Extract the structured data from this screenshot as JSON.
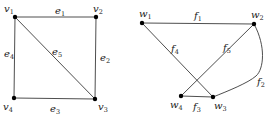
{
  "graphs": [
    {
      "name": "G",
      "vertices": [
        {
          "id": "v1",
          "base": "v",
          "sub": "1",
          "x": 15,
          "y": 17,
          "lx": 4,
          "ly": 12
        },
        {
          "id": "v2",
          "base": "v",
          "sub": "2",
          "x": 96,
          "y": 17,
          "lx": 93,
          "ly": 12
        },
        {
          "id": "v3",
          "base": "v",
          "sub": "3",
          "x": 95,
          "y": 99,
          "lx": 98,
          "ly": 110
        },
        {
          "id": "v4",
          "base": "v",
          "sub": "4",
          "x": 14,
          "y": 98,
          "lx": 3,
          "ly": 110
        }
      ],
      "edges": [
        {
          "id": "e1",
          "base": "e",
          "sub": "1",
          "from": "v1",
          "to": "v2",
          "lx": 55,
          "ly": 14
        },
        {
          "id": "e2",
          "base": "e",
          "sub": "2",
          "from": "v2",
          "to": "v3",
          "lx": 100,
          "ly": 61
        },
        {
          "id": "e3",
          "base": "e",
          "sub": "3",
          "from": "v4",
          "to": "v3",
          "lx": 50,
          "ly": 112
        },
        {
          "id": "e4",
          "base": "e",
          "sub": "4",
          "from": "v1",
          "to": "v4",
          "lx": 4,
          "ly": 57
        },
        {
          "id": "e5",
          "base": "e",
          "sub": "5",
          "from": "v1",
          "to": "v3",
          "lx": 52,
          "ly": 55
        }
      ]
    },
    {
      "name": "H",
      "vertices": [
        {
          "id": "w1",
          "base": "w",
          "sub": "1",
          "x": 142,
          "y": 23,
          "lx": 139,
          "ly": 17
        },
        {
          "id": "w2",
          "base": "w",
          "sub": "2",
          "x": 254,
          "y": 24,
          "lx": 251,
          "ly": 18
        },
        {
          "id": "w3",
          "base": "w",
          "sub": "3",
          "x": 213,
          "y": 97,
          "lx": 214,
          "ly": 109
        },
        {
          "id": "w4",
          "base": "w",
          "sub": "4",
          "x": 181,
          "y": 96,
          "lx": 170,
          "ly": 108
        }
      ],
      "edges": [
        {
          "id": "f1",
          "base": "f",
          "sub": "1",
          "from": "w1",
          "to": "w2",
          "lx": 194,
          "ly": 19,
          "curve": false
        },
        {
          "id": "f2",
          "base": "f",
          "sub": "2",
          "from": "w2",
          "to": "w3",
          "lx": 257,
          "ly": 85,
          "curve": true
        },
        {
          "id": "f3",
          "base": "f",
          "sub": "3",
          "from": "w4",
          "to": "w3",
          "lx": 193,
          "ly": 110,
          "curve": false
        },
        {
          "id": "f4",
          "base": "f",
          "sub": "4",
          "from": "w1",
          "to": "w3",
          "lx": 171,
          "ly": 52,
          "curve": false
        },
        {
          "id": "f5",
          "base": "f",
          "sub": "5",
          "from": "w4",
          "to": "w2",
          "lx": 223,
          "ly": 51,
          "curve": false
        }
      ]
    }
  ]
}
